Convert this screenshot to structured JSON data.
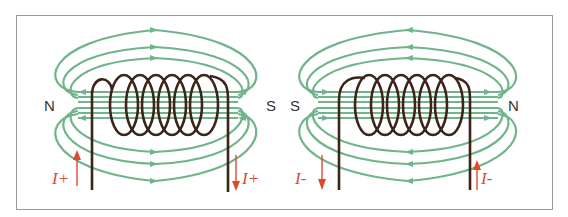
{
  "figure": {
    "colors": {
      "field_lines": "#6fb48a",
      "coil": "#3d2418",
      "current_arrow": "#e0492b",
      "border": "#9a9a9a",
      "label": "#333333"
    },
    "panels": [
      {
        "id": "left",
        "left_pole": "N",
        "right_pole": "S",
        "current_left_label": "I+",
        "current_right_label": "I+",
        "current_left_direction": "up",
        "current_right_direction": "down",
        "outer_field_direction": "left-to-right",
        "inner_field_direction": "right-to-left",
        "turns": 7
      },
      {
        "id": "right",
        "left_pole": "S",
        "right_pole": "N",
        "current_left_label": "I-",
        "current_right_label": "I-",
        "current_left_direction": "down",
        "current_right_direction": "up",
        "outer_field_direction": "right-to-left",
        "inner_field_direction": "left-to-right",
        "turns": 7
      }
    ]
  }
}
